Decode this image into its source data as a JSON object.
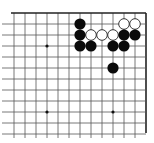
{
  "board": {
    "origin_x": 14,
    "origin_y": 13,
    "spacing": 11,
    "cols": 13,
    "rows": 12,
    "line_color": "#555555",
    "edge_color": "#222222",
    "background": "#ffffff",
    "visible_edges": [
      "top",
      "right"
    ],
    "star_points": [
      [
        3,
        3
      ],
      [
        9,
        9
      ],
      [
        3,
        9
      ]
    ],
    "stones": {
      "black": [
        [
          6,
          1
        ],
        [
          6,
          2
        ],
        [
          6,
          3
        ],
        [
          7,
          3
        ],
        [
          9,
          3
        ],
        [
          10,
          3
        ],
        [
          10,
          2
        ],
        [
          11,
          2
        ],
        [
          9,
          5
        ]
      ],
      "white": [
        [
          7,
          2
        ],
        [
          8,
          2
        ],
        [
          9,
          2
        ],
        [
          10,
          1
        ],
        [
          11,
          1
        ]
      ]
    },
    "colors": {
      "black_stone": "#0a0a0a",
      "white_stone_fill": "#ffffff",
      "white_stone_stroke": "#222222"
    }
  }
}
